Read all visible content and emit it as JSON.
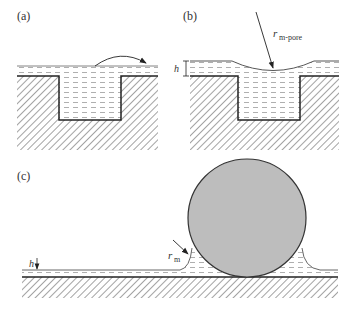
{
  "panels": {
    "a": {
      "label": "(a)"
    },
    "b": {
      "label": "(b)",
      "radius_label": "r",
      "radius_sub": "m-pore",
      "thickness_label": "h"
    },
    "c": {
      "label": "(c)",
      "radius_label": "r",
      "radius_sub": "m",
      "thickness_label": "h"
    }
  },
  "colors": {
    "line": "#333333",
    "hatch": "#555555",
    "liquid_dash": "#9a9a9a",
    "sphere_fill": "#bdbdbd",
    "background": "#ffffff"
  }
}
